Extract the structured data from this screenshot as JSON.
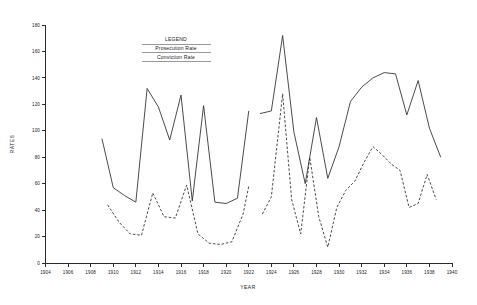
{
  "chart_data": {
    "type": "line",
    "title": "",
    "xlabel": "YEAR",
    "ylabel": "RATES",
    "xlim": [
      1904,
      1940
    ],
    "ylim": [
      0,
      180
    ],
    "xticks": [
      1904,
      1906,
      1908,
      1910,
      1912,
      1914,
      1916,
      1918,
      1920,
      1922,
      1924,
      1926,
      1928,
      1930,
      1932,
      1934,
      1936,
      1938,
      1940
    ],
    "yticks": [
      0,
      20,
      40,
      60,
      80,
      100,
      120,
      140,
      160,
      180
    ],
    "grid": false,
    "legend": {
      "title": "LEGEND",
      "position": "inside-top-center",
      "entries": [
        {
          "label": "Prosecution Rate",
          "style": "solid"
        },
        {
          "label": "Conviction Rate",
          "style": "dashed"
        }
      ]
    },
    "series": [
      {
        "name": "Prosecution Rate",
        "style": "solid",
        "segments": [
          {
            "x": [
              1909.0,
              1910.0,
              1911.0,
              1912.0,
              1913.0,
              1914.0,
              1915.0,
              1916.0,
              1917.0,
              1918.0,
              1919.0,
              1920.0,
              1921.0,
              1922.0
            ],
            "y": [
              94,
              57,
              51,
              46,
              132,
              118,
              93,
              127,
              47,
              119,
              46,
              45,
              49,
              115
            ]
          },
          {
            "x": [
              1923.0,
              1924.0,
              1925.0,
              1926.0,
              1927.0,
              1928.0,
              1929.0,
              1930.0,
              1931.0,
              1932.0,
              1933.0,
              1934.0,
              1935.0,
              1936.0,
              1937.0,
              1938.0,
              1939.0
            ],
            "y": [
              113,
              115,
              172,
              99,
              60,
              110,
              64,
              88,
              122,
              133,
              140,
              144,
              143,
              112,
              138,
              102,
              80
            ]
          }
        ]
      },
      {
        "name": "Conviction Rate",
        "style": "dashed",
        "segments": [
          {
            "x": [
              1909.5,
              1910.5,
              1911.5,
              1912.5,
              1913.5,
              1914.5,
              1915.5,
              1916.5,
              1917.5,
              1918.5,
              1919.5,
              1920.5,
              1921.5,
              1922.0
            ],
            "y": [
              44,
              31,
              22,
              21,
              53,
              35,
              34,
              59,
              22,
              15,
              14,
              16,
              37,
              58
            ]
          },
          {
            "x": [
              1923.2,
              1924.0,
              1925.0,
              1925.8,
              1926.6,
              1927.4,
              1928.2,
              1929.0,
              1929.8,
              1930.6,
              1931.4,
              1932.2,
              1933.0,
              1933.8,
              1934.6,
              1935.4,
              1936.2,
              1937.0,
              1937.8,
              1938.6
            ],
            "y": [
              37,
              50,
              128,
              48,
              22,
              80,
              35,
              12,
              42,
              55,
              62,
              76,
              88,
              82,
              75,
              70,
              42,
              45,
              67,
              48
            ]
          }
        ]
      }
    ]
  },
  "axes": {
    "y_title": "RATES",
    "x_title": "YEAR",
    "y_tick_labels": [
      "0",
      "20",
      "40",
      "60",
      "80",
      "100",
      "120",
      "140",
      "160",
      "180"
    ],
    "x_tick_labels": [
      "1904",
      "1906",
      "1908",
      "1910",
      "1912",
      "1914",
      "1916",
      "1918",
      "1920",
      "1922",
      "1924",
      "1926",
      "1928",
      "1930",
      "1932",
      "1934",
      "1936",
      "1938",
      "1940"
    ]
  },
  "legend": {
    "title": "LEGEND",
    "entry_1": "Prosecution Rate",
    "entry_2": "Conviction Rate"
  },
  "colors": {
    "ink": "#2b2b2b",
    "background": "#ffffff"
  }
}
